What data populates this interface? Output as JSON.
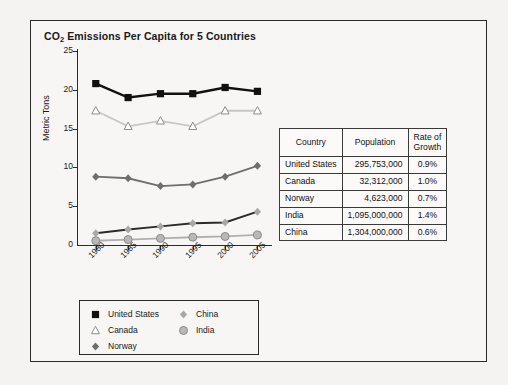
{
  "chart_data": {
    "type": "line",
    "title": "CO2 Emissions Per Capita for 5 Countries",
    "title_main": "CO",
    "title_sub": "2",
    "title_rest": " Emissions Per Capita for 5 Countries",
    "xlabel": "",
    "ylabel": "Metric Tons",
    "x": [
      "1980",
      "1985",
      "1990",
      "1995",
      "2000",
      "2005"
    ],
    "ylim": [
      0,
      25
    ],
    "yticks": [
      0,
      5,
      10,
      15,
      20,
      25
    ],
    "grid": false,
    "legend_position": "bottom",
    "series": [
      {
        "name": "United States",
        "marker": "filled-square",
        "color": "#111111",
        "values": [
          20.8,
          19.0,
          19.5,
          19.5,
          20.3,
          19.8
        ]
      },
      {
        "name": "Canada",
        "marker": "open-triangle",
        "color": "#c6c6c6",
        "values": [
          17.3,
          15.3,
          16.0,
          15.3,
          17.3,
          17.3
        ]
      },
      {
        "name": "Norway",
        "marker": "filled-diamond",
        "color": "#6e6e6e",
        "values": [
          8.8,
          8.6,
          7.6,
          7.8,
          8.8,
          10.2
        ]
      },
      {
        "name": "China",
        "marker": "light-diamond",
        "color": "#2b2b2b",
        "values": [
          1.5,
          2.0,
          2.4,
          2.8,
          2.9,
          4.3
        ]
      },
      {
        "name": "India",
        "marker": "gray-circle",
        "color": "#b0b0b0",
        "values": [
          0.55,
          0.7,
          0.85,
          1.0,
          1.1,
          1.3
        ]
      }
    ]
  },
  "legend": {
    "items": [
      {
        "label": "United States",
        "marker": "filled-square"
      },
      {
        "label": "Canada",
        "marker": "open-triangle"
      },
      {
        "label": "Norway",
        "marker": "filled-diamond"
      },
      {
        "label": "China",
        "marker": "light-diamond"
      },
      {
        "label": "India",
        "marker": "gray-circle"
      }
    ]
  },
  "table": {
    "headers": [
      "Country",
      "Population",
      "Rate of Growth"
    ],
    "header_rate_line1": "Rate of",
    "header_rate_line2": "Growth",
    "rows": [
      {
        "country": "United States",
        "population": "295,753,000",
        "rate": "0.9%"
      },
      {
        "country": "Canada",
        "population": "32,312,000",
        "rate": "1.0%"
      },
      {
        "country": "Norway",
        "population": "4,623,000",
        "rate": "0.7%"
      },
      {
        "country": "India",
        "population": "1,095,000,000",
        "rate": "1.4%"
      },
      {
        "country": "China",
        "population": "1,304,000,000",
        "rate": "0.6%"
      }
    ]
  }
}
